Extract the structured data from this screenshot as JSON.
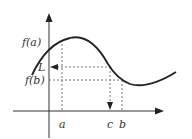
{
  "diagram": {
    "type": "function-graph",
    "colors": {
      "curve": "#222222",
      "axis": "#333333",
      "guide": "#777777",
      "text": "#333333"
    },
    "labels": {
      "f_a": "f(a)",
      "L": "L",
      "f_b": "f(b)",
      "a": "a",
      "c": "c",
      "b": "b"
    }
  }
}
